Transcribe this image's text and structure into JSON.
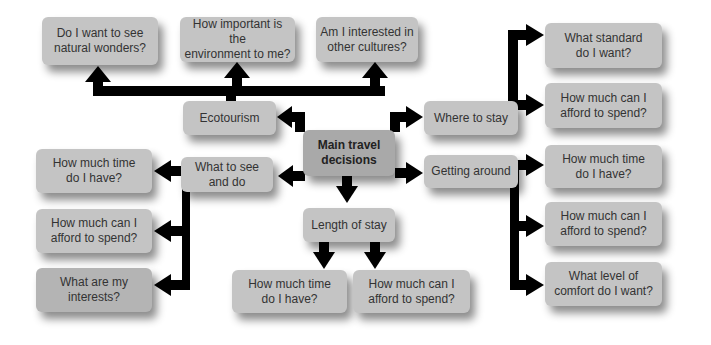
{
  "diagram": {
    "center": {
      "label": "Main travel\ndecisions"
    },
    "ecotourism": {
      "label": "Ecotourism",
      "questions": [
        "Do I want to see\nnatural wonders?",
        "How important is the\nenvironment to me?",
        "Am I interested in\nother cultures?"
      ]
    },
    "see_and_do": {
      "label": "What to see\nand do",
      "questions": [
        "How much time\ndo I have?",
        "How much can I\nafford to spend?",
        "What are my\ninterests?"
      ]
    },
    "length_of_stay": {
      "label": "Length of stay",
      "questions": [
        "How much time\ndo I have?",
        "How much can I\nafford to spend?"
      ]
    },
    "where_to_stay": {
      "label": "Where to stay",
      "questions": [
        "What standard\ndo I want?",
        "How much can I\nafford to spend?"
      ]
    },
    "getting_around": {
      "label": "Getting around",
      "questions": [
        "How much time\ndo I have?",
        "How much can I\nafford to spend?",
        "What level of\ncomfort do I want?"
      ]
    }
  }
}
